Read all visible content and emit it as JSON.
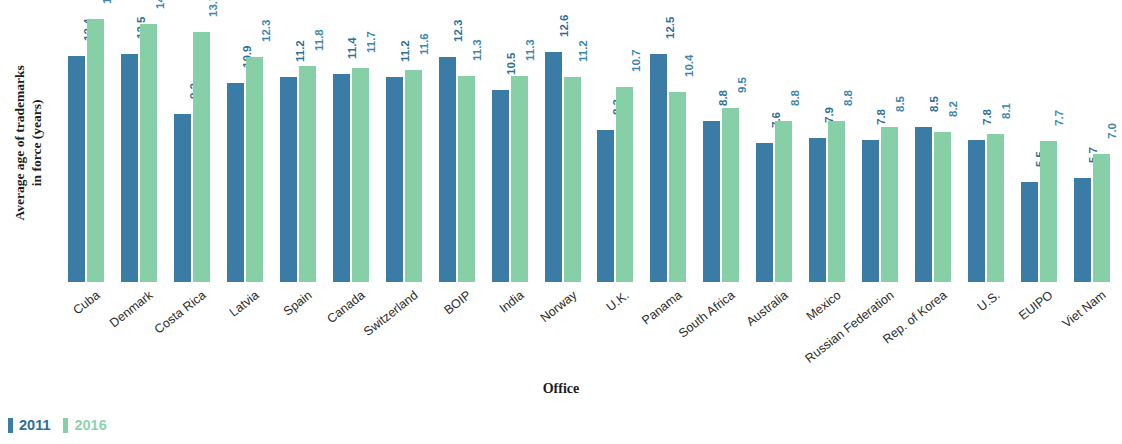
{
  "chart_data": {
    "type": "bar",
    "title": "",
    "xlabel": "Office",
    "ylabel": "Average age of trademarks\nin force (years)",
    "ylim": [
      0,
      15
    ],
    "grid": false,
    "legend_position": "bottom-left",
    "categories": [
      "Cuba",
      "Denmark",
      "Costa Rica",
      "Latvia",
      "Spain",
      "Canada",
      "Switzerland",
      "BOIP",
      "India",
      "Norway",
      "U.K.",
      "Panama",
      "South Africa",
      "Australia",
      "Mexico",
      "Russian Federation",
      "Rep. of Korea",
      "U.S.",
      "EUIPO",
      "Viet Nam"
    ],
    "series": [
      {
        "name": "2011",
        "color": "#3b7ca6",
        "values": [
          12.4,
          12.5,
          9.2,
          10.9,
          11.2,
          11.4,
          11.2,
          12.3,
          10.5,
          12.6,
          8.3,
          12.5,
          8.8,
          7.6,
          7.9,
          7.8,
          8.5,
          7.8,
          5.5,
          5.7
        ]
      },
      {
        "name": "2016",
        "color": "#87cfa7",
        "values": [
          14.4,
          14.1,
          13.7,
          12.3,
          11.8,
          11.7,
          11.6,
          11.3,
          11.3,
          11.2,
          10.7,
          10.4,
          9.5,
          8.8,
          8.8,
          8.5,
          8.2,
          8.1,
          7.7,
          7.0
        ]
      }
    ],
    "value_label_format": "one-decimal",
    "value_label_rotation": 90
  },
  "axis": {
    "y_title_line1": "Average age of trademarks",
    "y_title_line2": "in force (years)",
    "x_title": "Office"
  },
  "legend": {
    "items": [
      {
        "label": "2011",
        "color": "#3b7ca6"
      },
      {
        "label": "2016",
        "color": "#87cfa7"
      }
    ]
  }
}
